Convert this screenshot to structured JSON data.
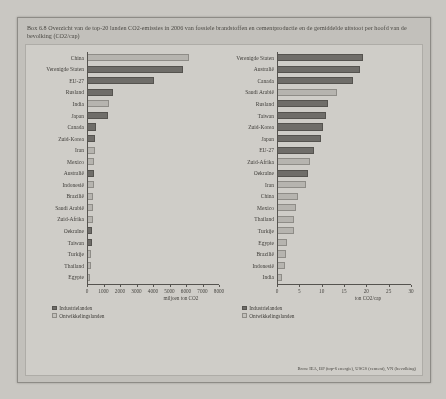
{
  "box": {
    "title": "Box 6.8 Overzicht van de top-20 landen CO2-emissies in 2006 van fossiele brandstoffen en cementproductie en de gemiddelde uitstoot per hoofd van de bevolking (CO2/cap)"
  },
  "legend": {
    "industrialized": "Industrielanden",
    "developing": "Ontwikkelingslanden"
  },
  "source": "Bron: IEA, BP (top-6 energie), USGS (cement), VN (bevolking)",
  "colors": {
    "industrialized": "#6f6d69",
    "developing": "#b6b4af",
    "axis": "#55534f",
    "panel": "#cfcdc8",
    "box": "#c2c0bb"
  },
  "chart_data": [
    {
      "type": "bar",
      "orientation": "horizontal",
      "id": "total-emissions",
      "title": "",
      "xlabel": "miljoen ton CO2",
      "ylabel": "",
      "xlim": [
        0,
        8000
      ],
      "xticks": [
        0,
        1000,
        2000,
        3000,
        4000,
        5000,
        6000,
        7000,
        8000
      ],
      "xticklabels": [
        "0",
        "1000",
        "2000",
        "3000",
        "4000",
        "5000",
        "6000",
        "7000",
        "8000"
      ],
      "grid": false,
      "legend_position": "bottom-left",
      "categories": [
        "China",
        "Verenigde Staten",
        "EU-27",
        "Rusland",
        "India",
        "Japan",
        "Canada",
        "Zuid-Korea",
        "Iran",
        "Mexico",
        "Australië",
        "Indonesië",
        "Brazilië",
        "Saudi Arabië",
        "Zuid-Afrika",
        "Oekraïne",
        "Taiwan",
        "Turkije",
        "Thailand",
        "Egypte"
      ],
      "values": [
        6200,
        5800,
        4050,
        1600,
        1350,
        1250,
        570,
        500,
        470,
        440,
        420,
        400,
        380,
        370,
        350,
        330,
        300,
        270,
        250,
        180
      ],
      "groups": [
        "dev",
        "ind",
        "ind",
        "ind",
        "dev",
        "ind",
        "ind",
        "ind",
        "dev",
        "dev",
        "ind",
        "dev",
        "dev",
        "dev",
        "dev",
        "ind",
        "ind",
        "dev",
        "dev",
        "dev"
      ]
    },
    {
      "type": "bar",
      "orientation": "horizontal",
      "id": "per-capita-emissions",
      "title": "",
      "xlabel": "ton CO2/cap",
      "ylabel": "",
      "xlim": [
        0,
        30
      ],
      "xticks": [
        0,
        5,
        10,
        15,
        20,
        25,
        30
      ],
      "xticklabels": [
        "0",
        "5",
        "10",
        "15",
        "20",
        "25",
        "30"
      ],
      "grid": false,
      "legend_position": "bottom-left",
      "categories": [
        "Verenigde Staten",
        "Australië",
        "Canada",
        "Saudi Arabië",
        "Rusland",
        "Taiwan",
        "Zuid-Korea",
        "Japan",
        "EU-27",
        "Zuid-Afrika",
        "Oekraïne",
        "Iran",
        "China",
        "Mexico",
        "Thailand",
        "Turkije",
        "Egypte",
        "Brazilië",
        "Indonesië",
        "India"
      ],
      "values": [
        19.3,
        18.5,
        17.0,
        13.5,
        11.4,
        11.0,
        10.3,
        9.8,
        8.2,
        7.3,
        7.0,
        6.6,
        4.7,
        4.2,
        3.9,
        3.7,
        2.3,
        2.0,
        1.7,
        1.2
      ],
      "groups": [
        "ind",
        "ind",
        "ind",
        "dev",
        "ind",
        "ind",
        "ind",
        "ind",
        "ind",
        "dev",
        "ind",
        "dev",
        "dev",
        "dev",
        "dev",
        "dev",
        "dev",
        "dev",
        "dev",
        "dev"
      ]
    }
  ]
}
